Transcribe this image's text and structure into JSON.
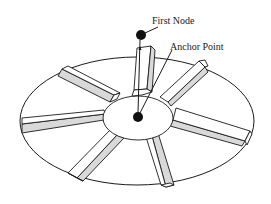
{
  "diagram": {
    "type": "isometric disc with radial ribs",
    "labels": {
      "first_node": "First Node",
      "anchor_point": "Anchor Point"
    },
    "rib_count": 7,
    "colors": {
      "line": "#1a1a1a",
      "rib_shade": "#d9d9d9",
      "background": "#ffffff",
      "node_fill": "#111111"
    }
  }
}
